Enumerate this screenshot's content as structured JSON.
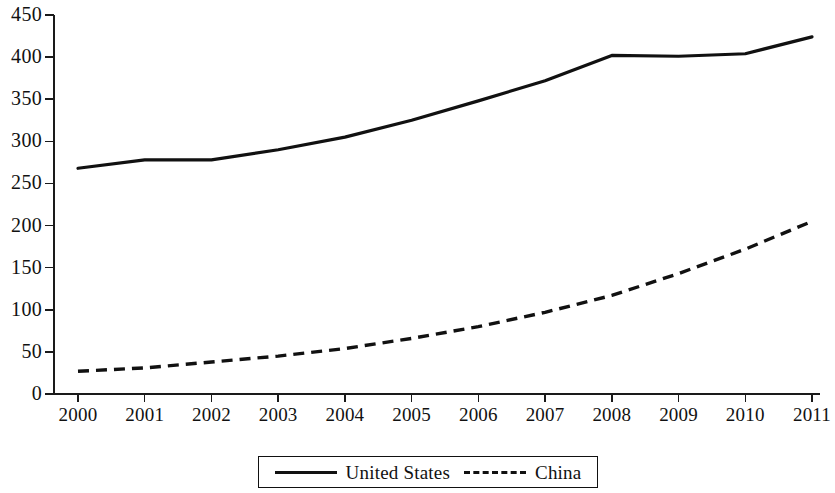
{
  "chart_data": {
    "type": "line",
    "title": "",
    "xlabel": "",
    "ylabel": "",
    "categories": [
      "2000",
      "2001",
      "2002",
      "2003",
      "2004",
      "2005",
      "2006",
      "2007",
      "2008",
      "2009",
      "2010",
      "2011"
    ],
    "x": [
      2000,
      2001,
      2002,
      2003,
      2004,
      2005,
      2006,
      2007,
      2008,
      2009,
      2010,
      2011
    ],
    "ylim": [
      0,
      450
    ],
    "yticks": [
      0,
      50,
      100,
      150,
      200,
      250,
      300,
      350,
      400,
      450
    ],
    "ytick_labels": [
      "0",
      "50",
      "100",
      "150",
      "200",
      "250",
      "300",
      "350",
      "400",
      "450"
    ],
    "grid": false,
    "legend_position": "bottom",
    "series": [
      {
        "name": "United States",
        "style": "solid",
        "color": "#111111",
        "values": [
          268,
          278,
          278,
          290,
          305,
          325,
          348,
          372,
          402,
          401,
          404,
          424
        ]
      },
      {
        "name": "China",
        "style": "dashed",
        "color": "#111111",
        "values": [
          27,
          31,
          38,
          45,
          54,
          66,
          80,
          97,
          117,
          143,
          172,
          205
        ]
      }
    ]
  },
  "legend": {
    "items": [
      {
        "label": "United States",
        "style": "solid"
      },
      {
        "label": "China",
        "style": "dashed"
      }
    ]
  }
}
